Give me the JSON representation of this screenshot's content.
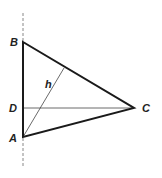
{
  "diagram": {
    "type": "geometry-triangle",
    "colors": {
      "stroke": "#1a1a1a",
      "thin": "#444444",
      "axis": "#888888",
      "label": "#222222"
    },
    "points": {
      "A": {
        "label": "A",
        "x": 23,
        "y": 137
      },
      "B": {
        "label": "B",
        "x": 23,
        "y": 42
      },
      "C": {
        "label": "C",
        "x": 134,
        "y": 108
      },
      "D": {
        "label": "D",
        "x": 23,
        "y": 108
      }
    },
    "labels": {
      "A": "A",
      "B": "B",
      "C": "C",
      "D": "D",
      "h": "h"
    }
  }
}
